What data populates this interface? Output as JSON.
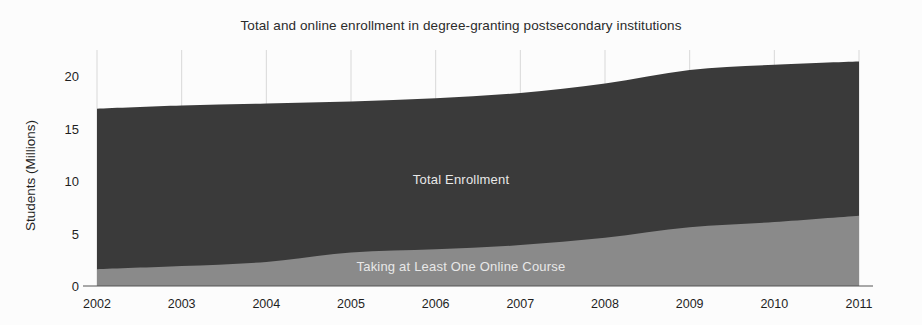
{
  "chart_data": {
    "type": "area",
    "title": "Total and online enrollment in degree-granting postsecondary institutions",
    "xlabel": "",
    "ylabel": "Students (Millions)",
    "stacked": false,
    "grid": "vertical",
    "legend_position": "inline-labels",
    "categories": [
      "2002",
      "2003",
      "2004",
      "2005",
      "2006",
      "2007",
      "2008",
      "2009",
      "2010",
      "2011"
    ],
    "x": [
      2002,
      2003,
      2004,
      2005,
      2006,
      2007,
      2008,
      2009,
      2010,
      2011
    ],
    "xlim": [
      2002,
      2011
    ],
    "ylim": [
      0,
      22.5
    ],
    "yticks": [
      0,
      5,
      10,
      15,
      20
    ],
    "ytick_labels": [
      "0",
      "5",
      "10",
      "15",
      "20"
    ],
    "series": [
      {
        "name": "Total Enrollment",
        "color": "#3a3a3a",
        "values": [
          16.9,
          17.2,
          17.4,
          17.6,
          17.9,
          18.4,
          19.3,
          20.6,
          21.1,
          21.4
        ]
      },
      {
        "name": "Taking at Least One Online Course",
        "color": "#8a8a8a",
        "values": [
          1.6,
          1.9,
          2.3,
          3.2,
          3.5,
          3.9,
          4.6,
          5.6,
          6.1,
          6.7
        ]
      }
    ],
    "annotations": [
      {
        "text": "Total Enrollment",
        "series": "Total Enrollment"
      },
      {
        "text": "Taking at Least One Online Course",
        "series": "Taking at Least One Online Course"
      }
    ],
    "colors": {
      "total_enrollment": "#3a3a3a",
      "online_course": "#8a8a8a",
      "background": "#fcfcfc",
      "axis": "#555555",
      "gridline": "#d8d8d8",
      "label_text": "#1f1f1f",
      "inline_label_text": "#e8e8e8"
    }
  }
}
